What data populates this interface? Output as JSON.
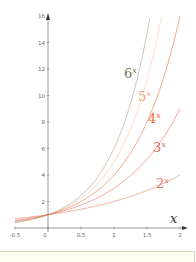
{
  "chart_data": {
    "type": "line",
    "title": "",
    "xlabel": "x",
    "ylabel": "",
    "xlim": [
      -0.5,
      2
    ],
    "ylim": [
      0,
      16
    ],
    "grid": false,
    "x_ticks": [
      "-0.5",
      "0",
      "0.5",
      "1",
      "1.5",
      "2"
    ],
    "y_ticks": [
      "2",
      "4",
      "6",
      "8",
      "10",
      "12",
      "14",
      "16"
    ],
    "series": [
      {
        "name": "2^x",
        "base": 2,
        "color": "#e87a6a",
        "x": [
          -0.5,
          0,
          0.5,
          1,
          1.5,
          2
        ],
        "values": [
          0.71,
          1,
          1.41,
          2,
          2.83,
          4
        ]
      },
      {
        "name": "3^x",
        "base": 3,
        "color": "#e56a5a",
        "x": [
          -0.5,
          0,
          0.5,
          1,
          1.5,
          2
        ],
        "values": [
          0.58,
          1,
          1.73,
          3,
          5.2,
          9
        ]
      },
      {
        "name": "4^x",
        "base": 4,
        "color": "#ee6a3e",
        "x": [
          -0.5,
          0,
          0.5,
          1,
          1.5,
          2
        ],
        "values": [
          0.5,
          1,
          2,
          4,
          8,
          16
        ]
      },
      {
        "name": "5^x",
        "base": 5,
        "color": "#f4a070",
        "x": [
          -0.5,
          0,
          0.5,
          1,
          1.5,
          1.72
        ],
        "values": [
          0.45,
          1,
          2.24,
          5,
          11.18,
          16
        ]
      },
      {
        "name": "6^x",
        "base": 6,
        "color": "#6b7a3a",
        "x": [
          -0.5,
          0,
          0.5,
          1,
          1.5,
          1.55
        ],
        "values": [
          0.41,
          1,
          2.45,
          6,
          14.7,
          16
        ]
      }
    ],
    "legend": "inline labels near curves"
  },
  "labels": {
    "six": {
      "base": "6",
      "exp": "x",
      "color": "#6b7a3a"
    },
    "five": {
      "base": "5",
      "exp": "x",
      "color": "#f4a070"
    },
    "four": {
      "base": "4",
      "exp": "x",
      "color": "#ee6a3e"
    },
    "three": {
      "base": "3",
      "exp": "x",
      "color": "#e56a5a"
    },
    "two": {
      "base": "2",
      "exp": "x",
      "color": "#e87a6a"
    }
  },
  "axis": {
    "x_label": "x"
  }
}
